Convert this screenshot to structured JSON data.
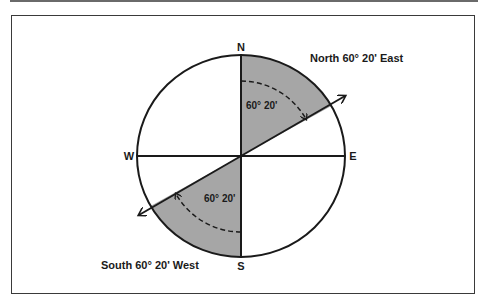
{
  "diagram": {
    "title": "",
    "compass": {
      "north_label": "N",
      "south_label": "S",
      "east_label": "E",
      "west_label": "W"
    },
    "bearings": [
      {
        "label": "North 60° 20' East",
        "angle_label": "60° 20'"
      },
      {
        "label": "South 60° 20' West",
        "angle_label": "60° 20'"
      }
    ],
    "colors": {
      "shading": "#a6a6a6",
      "stroke": "#1a1a1a",
      "frame": "#3a3a3a"
    }
  }
}
